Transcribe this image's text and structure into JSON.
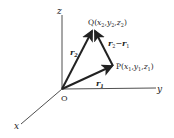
{
  "diagram": {
    "axes": {
      "x_label": "x",
      "y_label": "y",
      "z_label": "z",
      "origin_label": "O"
    },
    "points": {
      "P": {
        "name": "P",
        "coords_text": [
          "x",
          "1",
          "y",
          "1",
          "z",
          "1"
        ]
      },
      "Q": {
        "name": "Q",
        "coords_text": [
          "x",
          "2",
          "y",
          "2",
          "z",
          "2"
        ]
      }
    },
    "vectors": {
      "r1": {
        "base": "r",
        "sub": "1"
      },
      "r2": {
        "base": "r",
        "sub": "2"
      },
      "diff": {
        "a_base": "r",
        "a_sub": "2",
        "op": "−",
        "b_base": "r",
        "b_sub": "1"
      }
    },
    "colors": {
      "stroke": "#222222",
      "background": "#ffffff"
    }
  }
}
